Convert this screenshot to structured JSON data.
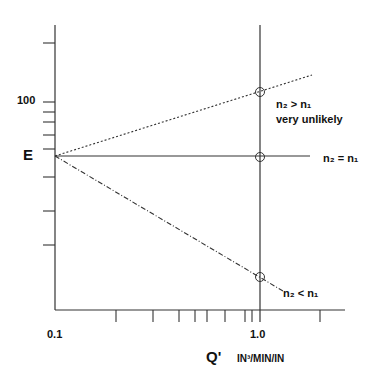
{
  "diagram": {
    "y_axis": {
      "label": "E",
      "tick_label_100": "100",
      "ticks_y_px": [
        43,
        102,
        112,
        122,
        135,
        149,
        177,
        211,
        245
      ]
    },
    "x_axis": {
      "label": "Q'",
      "units": "IN³/MIN/IN",
      "tick_label_left": "0.1",
      "tick_label_right": "1.0",
      "ticks_x_px": [
        116,
        153,
        179,
        195,
        207,
        225,
        245,
        252,
        260,
        320
      ]
    },
    "lines": [
      {
        "name": "n2 > n1",
        "style": "dotted",
        "label_main": "n₂ > n₁",
        "label_sub": "very unlikely"
      },
      {
        "name": "n2 = n1",
        "style": "solid",
        "label_main": "n₂ = n₁"
      },
      {
        "name": "n2 < n1",
        "style": "dash-dot",
        "label_main": "n₂ < n₁"
      }
    ],
    "colors": {
      "ink": "#222222",
      "background": "#ffffff"
    }
  }
}
